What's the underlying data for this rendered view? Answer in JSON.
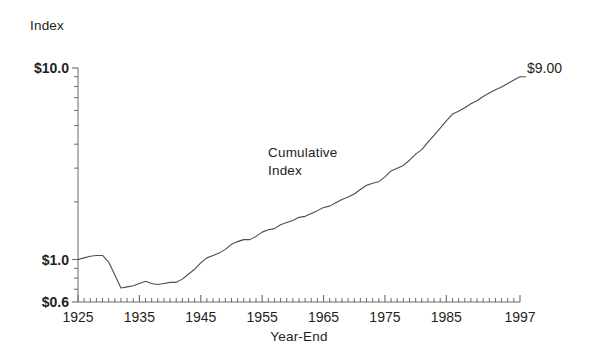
{
  "chart_data": {
    "type": "line",
    "title": "",
    "ylabel": "Index",
    "xlabel": "Year-End",
    "yscale": "log",
    "ylim": [
      0.6,
      10.0
    ],
    "xlim": [
      1925,
      1997
    ],
    "grid": false,
    "legend_position": "none",
    "y_tick_labels": [
      "$10.0",
      "$1.0",
      "$0.6"
    ],
    "y_tick_values": [
      10.0,
      1.0,
      0.6
    ],
    "y_minor_ticks": [
      0.7,
      0.8,
      0.9,
      2,
      3,
      4,
      5,
      6,
      7,
      8,
      9
    ],
    "x_tick_labels": [
      "1925",
      "1935",
      "1945",
      "1955",
      "1965",
      "1975",
      "1985",
      "1997"
    ],
    "x_tick_values": [
      1925,
      1935,
      1945,
      1955,
      1965,
      1975,
      1985,
      1997
    ],
    "x_minor_tick_interval": 1,
    "annotations": [
      {
        "text_line1": "Cumulative",
        "text_line2": "Index",
        "x": 1957,
        "y": 2.6
      },
      {
        "text": "$9.00",
        "x": 1997,
        "y": 9.0
      }
    ],
    "line_color": "#4d4d4d",
    "axis_color": "#6b6b6b",
    "series": [
      {
        "name": "Cumulative Index",
        "x": [
          1925,
          1926,
          1927,
          1928,
          1929,
          1930,
          1931,
          1932,
          1933,
          1934,
          1935,
          1936,
          1937,
          1938,
          1939,
          1940,
          1941,
          1942,
          1943,
          1944,
          1945,
          1946,
          1947,
          1948,
          1949,
          1950,
          1951,
          1952,
          1953,
          1954,
          1955,
          1956,
          1957,
          1958,
          1959,
          1960,
          1961,
          1962,
          1963,
          1964,
          1965,
          1966,
          1967,
          1968,
          1969,
          1970,
          1971,
          1972,
          1973,
          1974,
          1975,
          1976,
          1977,
          1978,
          1979,
          1980,
          1981,
          1982,
          1983,
          1984,
          1985,
          1986,
          1987,
          1988,
          1989,
          1990,
          1991,
          1992,
          1993,
          1994,
          1995,
          1996,
          1997
        ],
        "y": [
          1.0,
          1.02,
          1.04,
          1.05,
          1.05,
          0.97,
          0.83,
          0.71,
          0.72,
          0.73,
          0.75,
          0.77,
          0.75,
          0.74,
          0.75,
          0.76,
          0.76,
          0.79,
          0.84,
          0.89,
          0.96,
          1.02,
          1.05,
          1.08,
          1.13,
          1.2,
          1.24,
          1.27,
          1.27,
          1.32,
          1.39,
          1.43,
          1.45,
          1.52,
          1.56,
          1.6,
          1.66,
          1.68,
          1.74,
          1.8,
          1.87,
          1.9,
          1.98,
          2.06,
          2.12,
          2.2,
          2.32,
          2.44,
          2.5,
          2.55,
          2.7,
          2.9,
          3.0,
          3.1,
          3.3,
          3.55,
          3.75,
          4.1,
          4.45,
          4.85,
          5.3,
          5.75,
          5.95,
          6.2,
          6.5,
          6.75,
          7.1,
          7.4,
          7.7,
          7.95,
          8.3,
          8.65,
          9.0
        ]
      }
    ]
  }
}
